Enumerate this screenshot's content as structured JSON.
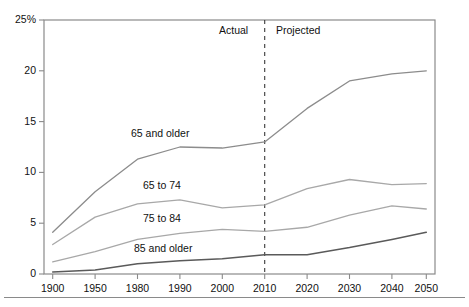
{
  "chart_data": {
    "type": "line",
    "title": "",
    "subtitle": "",
    "xlabel": "",
    "ylabel": "",
    "x": [
      "1900",
      "1950",
      "1980",
      "1990",
      "2000",
      "2010",
      "2020",
      "2030",
      "2040",
      "2050"
    ],
    "categories": [
      "1900",
      "1950",
      "1980",
      "1990",
      "2000",
      "2010",
      "2020",
      "2030",
      "2040",
      "2050"
    ],
    "ylim": [
      0,
      25
    ],
    "yticks": [
      0,
      5,
      10,
      15,
      20,
      25
    ],
    "ytick_labels": [
      "0",
      "5",
      "10",
      "15",
      "20",
      "25%"
    ],
    "grid": false,
    "legend": "inline-labels",
    "series": [
      {
        "name": "65 and older",
        "color": "#8c8c8c",
        "values": [
          4.1,
          8.1,
          11.3,
          12.5,
          12.4,
          13.0,
          16.3,
          19.0,
          19.7,
          20.0
        ]
      },
      {
        "name": "65 to 74",
        "color": "#a8a8a8",
        "values": [
          2.9,
          5.6,
          6.9,
          7.3,
          6.5,
          6.8,
          8.4,
          9.3,
          8.8,
          8.9
        ]
      },
      {
        "name": "75 to 84",
        "color": "#a8a8a8",
        "values": [
          1.2,
          2.2,
          3.4,
          4.0,
          4.4,
          4.2,
          4.6,
          5.8,
          6.7,
          6.4
        ]
      },
      {
        "name": "85 and older",
        "color": "#5a5a5a",
        "values": [
          0.2,
          0.4,
          1.0,
          1.3,
          1.5,
          1.9,
          1.9,
          2.6,
          3.4,
          4.1
        ]
      }
    ],
    "annotations": [
      {
        "text": "Actual",
        "at_x": "before 2010"
      },
      {
        "text": "Projected",
        "at_x": "after 2010"
      }
    ],
    "divider": {
      "at": "2010",
      "style": "dashed"
    }
  },
  "axes": {
    "y_tick_labels": [
      "25%",
      "20",
      "15",
      "10",
      "5",
      "0"
    ],
    "x_tick_labels": [
      "1900",
      "1950",
      "1980",
      "1990",
      "2000",
      "2010",
      "2020",
      "2030",
      "2040",
      "2050"
    ]
  },
  "series_labels": {
    "s0": "65 and older",
    "s1": "65 to 74",
    "s2": "75 to 84",
    "s3": "85 and older"
  },
  "period_labels": {
    "actual": "Actual",
    "projected": "Projected"
  },
  "colors": {
    "axis": "#8a8a8a",
    "line_top": "#8c8c8c",
    "line_mid": "#a8a8a8",
    "line_bottom": "#5a5a5a",
    "text": "#111111",
    "background": "#ffffff"
  }
}
